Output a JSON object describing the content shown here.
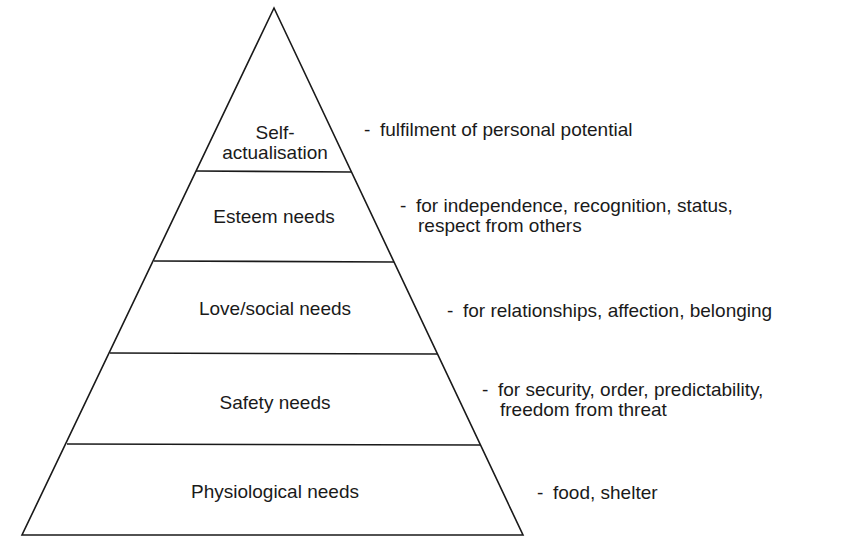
{
  "diagram": {
    "type": "pyramid",
    "line_color": "#1a1a1a",
    "levels": [
      {
        "name": "Self-actualisation",
        "label_line1": "Self-",
        "label_line2": "actualisation",
        "description_line1": "fulfilment of personal potential",
        "description_line2": ""
      },
      {
        "name": "Esteem needs",
        "label_line1": "Esteem needs",
        "description_line1": "for independence, recognition, status,",
        "description_line2": "respect from others"
      },
      {
        "name": "Love/social needs",
        "label_line1": "Love/social needs",
        "description_line1": "for relationships, affection, belonging",
        "description_line2": ""
      },
      {
        "name": "Safety needs",
        "label_line1": "Safety needs",
        "description_line1": "for security, order, predictability,",
        "description_line2": "freedom from threat"
      },
      {
        "name": "Physiological needs",
        "label_line1": "Physiological needs",
        "description_line1": "food, shelter",
        "description_line2": ""
      }
    ],
    "dash": "-"
  }
}
